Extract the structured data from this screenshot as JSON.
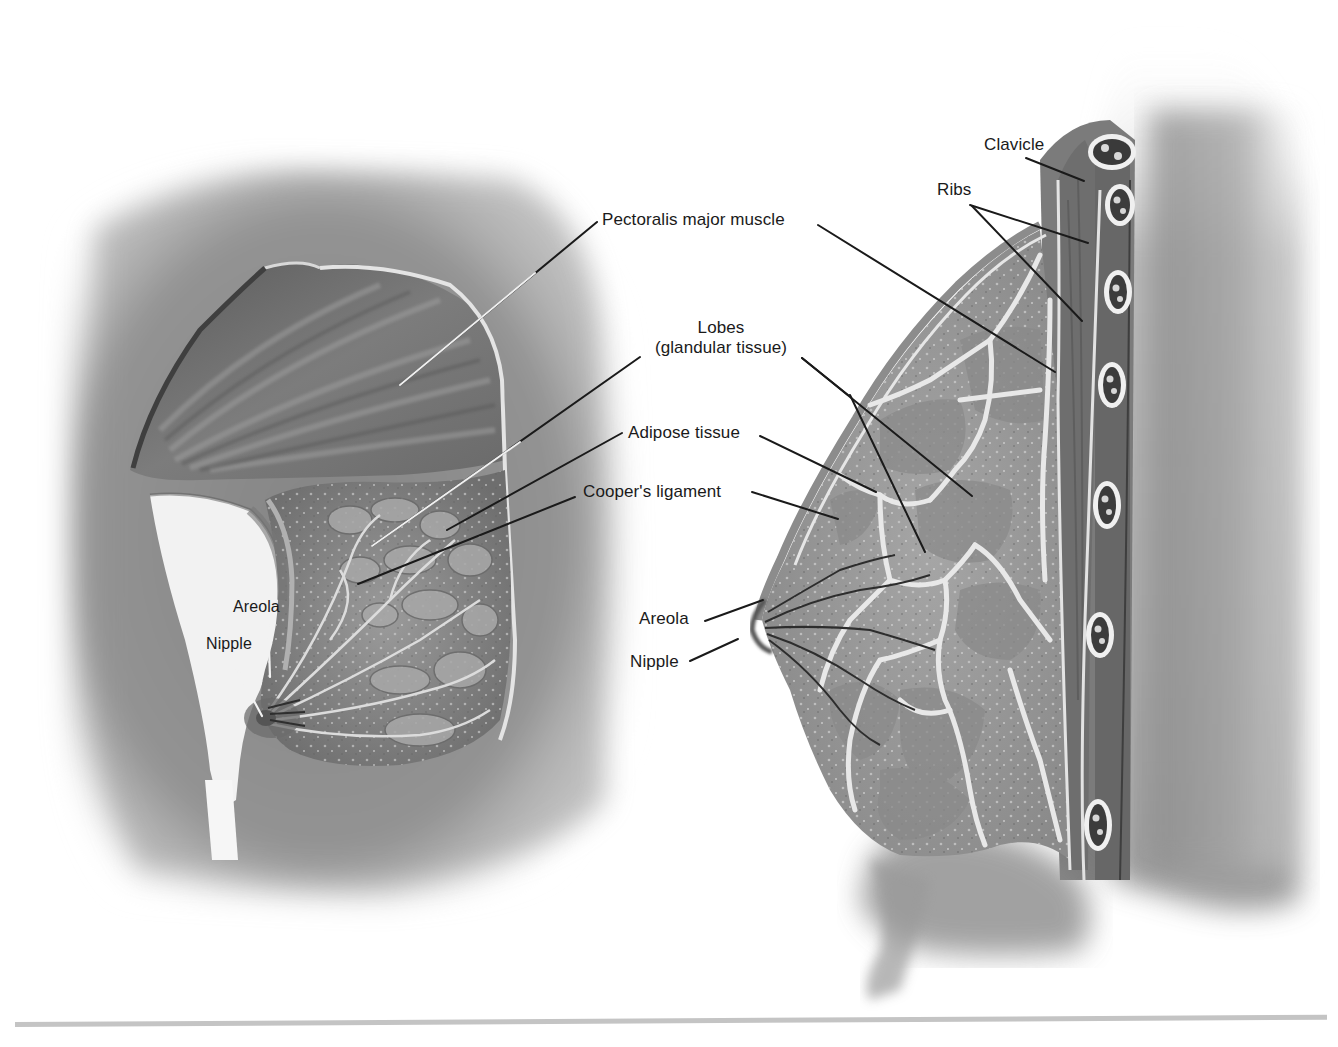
{
  "figure": {
    "type": "anatomical-illustration",
    "panels": [
      {
        "id": "left",
        "view": "anterior-oblique cutaway"
      },
      {
        "id": "right",
        "view": "sagittal section"
      }
    ]
  },
  "labels": {
    "pectoralis": "Pectoralis major muscle",
    "lobes_line1": "Lobes",
    "lobes_line2": "(glandular tissue)",
    "adipose": "Adipose tissue",
    "cooper": "Cooper's ligament",
    "clavicle": "Clavicle",
    "ribs": "Ribs",
    "areola_left": "Areola",
    "nipple_left": "Nipple",
    "areola_right": "Areola",
    "nipple_right": "Nipple"
  },
  "colors": {
    "background": "#ffffff",
    "label_text": "#1a1a1a",
    "leader_dark": "#1a1a1a",
    "leader_light": "#f2f2f2",
    "rule": "#c4c4c4"
  }
}
